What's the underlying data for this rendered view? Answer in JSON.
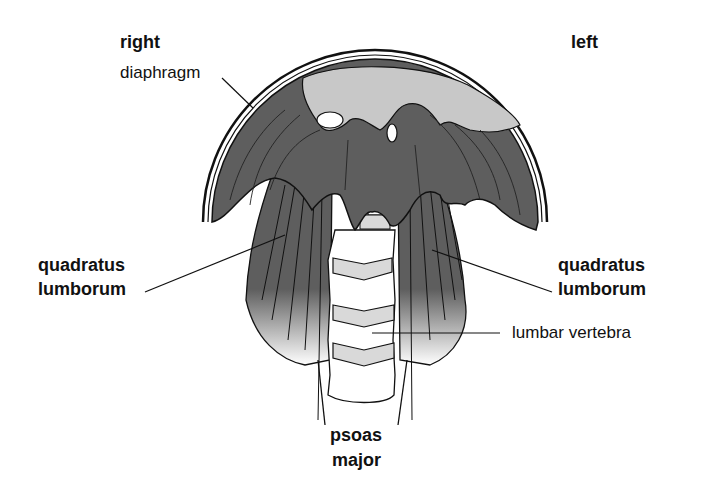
{
  "labels": {
    "right": "right",
    "left": "left",
    "diaphragm": "diaphragm",
    "quadratus_right_line1": "quadratus",
    "quadratus_right_line2": "lumborum",
    "quadratus_left_line1": "quadratus",
    "quadratus_left_line2": "lumborum",
    "lumbar_vertebra": "lumbar vertebra",
    "psoas_line1": "psoas",
    "psoas_line2": "major"
  },
  "colors": {
    "muscle_dark": "#5a5a5a",
    "muscle_light": "#c8c8c8",
    "bone": "#ffffff",
    "disc": "#d9d9d9",
    "outline": "#111111"
  }
}
